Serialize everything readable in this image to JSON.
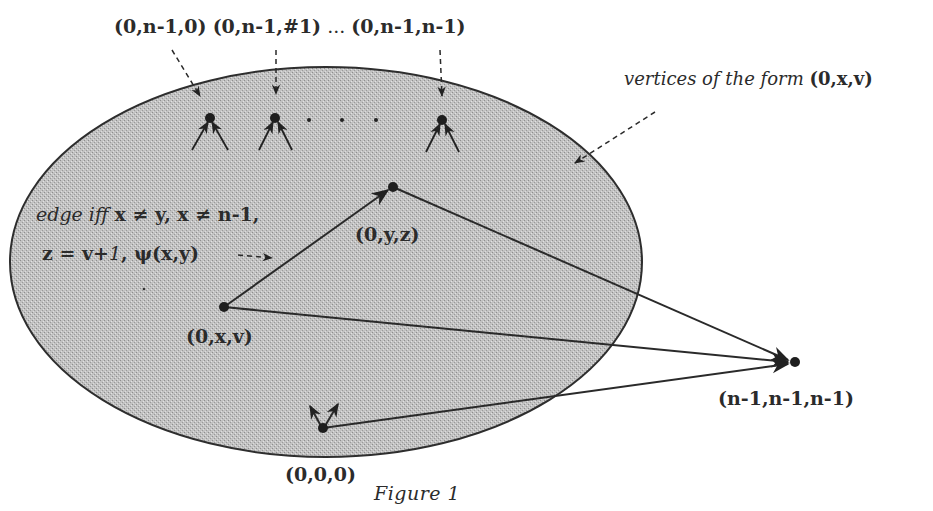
{
  "figure": {
    "caption": "Figure 1",
    "colors": {
      "ellipse_fill": "#b9b9b9",
      "ellipse_stroke": "#2e2e2e",
      "edge": "#2a2a2a",
      "node": "#1e1e1e",
      "background": "#ffffff"
    },
    "region": {
      "label_prefix": "vertices of the form ",
      "label_tuple": "(0,x,v)"
    },
    "top_labels": {
      "first": "(0,n-1,0)",
      "second": "(0,n-1,#1)",
      "ellipsis": "...",
      "last": "(0,n-1,n-1)"
    },
    "condition": {
      "line1_italic": "edge iff ",
      "line1_math": "x ≠ y, x ≠ n-1,",
      "line2_part1": "z = v+",
      "line2_italic": "1",
      "line2_part2": ", ψ(x,y)"
    },
    "nodes": {
      "yz": "(0,y,z)",
      "xv": "(0,x,v)",
      "origin": "(0,0,0)",
      "sink": "(n-1,n-1,n-1)"
    }
  }
}
